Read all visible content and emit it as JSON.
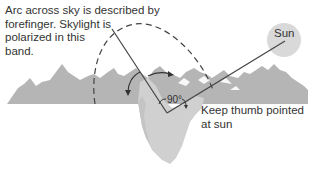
{
  "diagram": {
    "arc_caption": {
      "lines": [
        "Arc across sky is described by",
        "forefinger. Skylight is",
        "polarized in this",
        "band."
      ]
    },
    "thumb_caption": {
      "lines": [
        "Keep thumb pointed",
        "at sun"
      ]
    },
    "sun_label": "Sun",
    "angle_label": "90°",
    "colors": {
      "mountains": "#b3b3b3",
      "hand": "#cfcfcf",
      "sun": "#d6d6d6",
      "lines": "#444444",
      "text": "#333333"
    }
  }
}
